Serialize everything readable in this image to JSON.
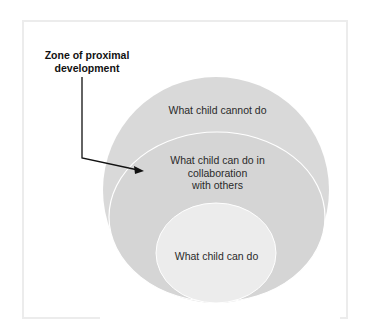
{
  "diagram": {
    "zone_label": "Zone of proximal development",
    "zone_label_line1": "Zone of proximal",
    "zone_label_line2": "development",
    "outer_circle_label": "What child cannot do",
    "middle_circle_label_line1": "What child can do in",
    "middle_circle_label_line2": "collaboration",
    "middle_circle_label_line3": "with others",
    "inner_circle_label": "What child can do",
    "colors": {
      "outer_fill": "#d9d9d9",
      "middle_fill": "#d6d6d6",
      "inner_fill": "#ececec",
      "outline": "#ffffff",
      "arrow": "#111111"
    }
  }
}
